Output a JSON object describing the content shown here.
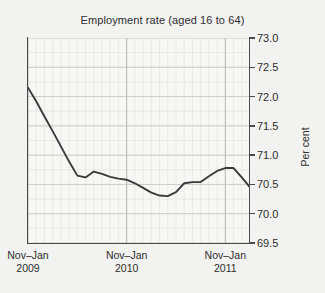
{
  "chart_data": {
    "type": "line",
    "title": "Employment rate (aged 16 to 64)",
    "xlabel": "",
    "ylabel": "Per cent",
    "ylim": [
      69.5,
      73.0
    ],
    "ytick_labels": [
      "73.0",
      "72.5",
      "72.0",
      "71.5",
      "71.0",
      "70.5",
      "70.0",
      "69.5"
    ],
    "ytick_values": [
      73.0,
      72.5,
      72.0,
      71.5,
      71.0,
      70.5,
      70.0,
      69.5
    ],
    "xtick_labels": [
      "Nov–Jan",
      "Nov–Jan",
      "Nov–Jan"
    ],
    "xtick_years": [
      "2009",
      "2010",
      "2011"
    ],
    "xtick_positions": [
      0,
      12,
      24
    ],
    "xlim": [
      0,
      27
    ],
    "grid": true,
    "grid_minor": true,
    "legend": "none",
    "line_color": "#3a3a3a",
    "background_color": "#f2f2f0",
    "plot_background_color": "#f7f7f5",
    "series": [
      {
        "name": "Employment rate (aged 16 to 64)",
        "x": [
          0,
          1,
          2,
          3,
          4,
          5,
          6,
          7,
          8,
          9,
          10,
          11,
          12,
          13,
          14,
          15,
          16,
          17,
          18,
          19,
          20,
          21,
          22,
          23,
          24,
          25,
          26,
          27
        ],
        "values": [
          72.15,
          71.92,
          71.66,
          71.41,
          71.15,
          70.89,
          70.65,
          70.62,
          70.72,
          70.68,
          70.63,
          70.6,
          70.58,
          70.52,
          70.44,
          70.36,
          70.31,
          70.3,
          70.37,
          70.52,
          70.54,
          70.54,
          70.64,
          70.73,
          70.78,
          70.78,
          70.62,
          70.45
        ]
      }
    ],
    "series_tail": {
      "x": [
        27,
        27.6
      ],
      "values": [
        70.45,
        70.5
      ]
    }
  }
}
